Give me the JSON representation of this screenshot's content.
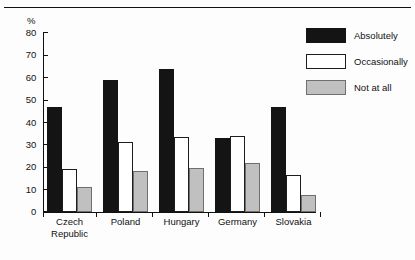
{
  "chart_data": {
    "type": "bar",
    "title": "",
    "subtitle": "",
    "xlabel": "",
    "ylabel": "%",
    "ylim": [
      0,
      80
    ],
    "yticks": [
      0,
      10,
      20,
      30,
      40,
      50,
      60,
      70,
      80
    ],
    "ytick_labels": [
      "0",
      "10",
      "20",
      "30",
      "40",
      "50",
      "60",
      "70",
      "80"
    ],
    "grid": false,
    "legend_position": "top-right",
    "categories": [
      "Czech\nRepublic",
      "Poland",
      "Hungary",
      "Germany",
      "Slovakia"
    ],
    "series": [
      {
        "name": "Absolutely",
        "color": "#141414",
        "values": [
          47,
          59,
          64,
          33,
          47
        ]
      },
      {
        "name": "Occasionally",
        "color": "#ffffff",
        "values": [
          19,
          31.5,
          33.5,
          34,
          16.5
        ]
      },
      {
        "name": "Not at all",
        "color": "#c0c0c0",
        "values": [
          11,
          18.5,
          19.5,
          22,
          7.5
        ]
      }
    ]
  },
  "legend": {
    "items": [
      {
        "label": "Absolutely"
      },
      {
        "label": "Occasionally"
      },
      {
        "label": "Not at all"
      }
    ]
  },
  "axes": {
    "y_unit_label": "%"
  },
  "colors": {
    "absolutely": "#141414",
    "occasionally": "#ffffff",
    "not_at_all": "#c0c0c0",
    "axis": "#111111",
    "background": "#fdfdfd"
  }
}
